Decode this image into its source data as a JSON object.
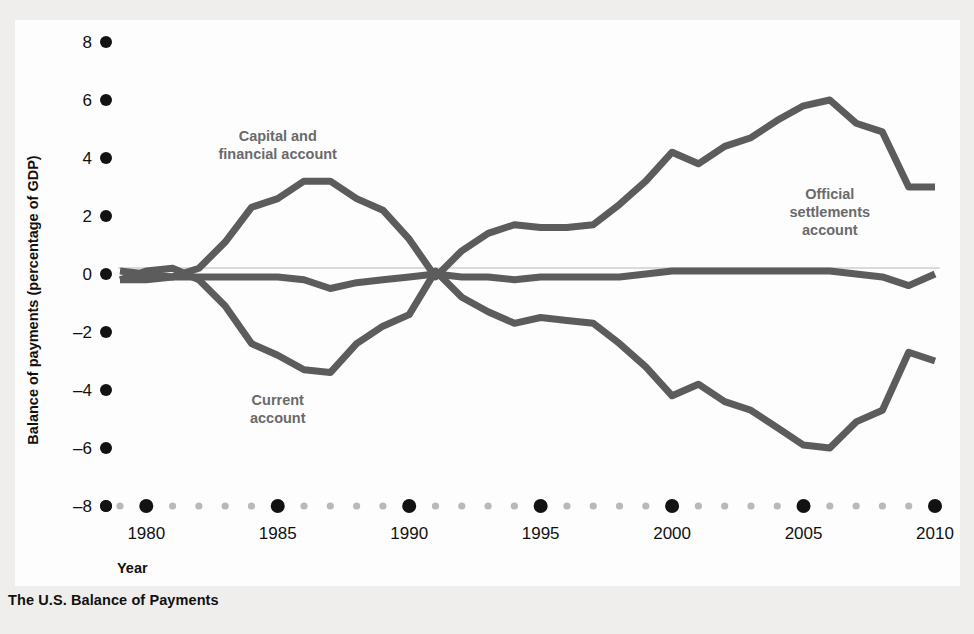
{
  "figure": {
    "caption": "The U.S. Balance of Payments",
    "background_color": "#efeeec",
    "panel_color": "#fdfdfd",
    "line_color": "#5c5c5c",
    "label_color": "#6a6a6a",
    "tick_major_color": "#121212",
    "tick_minor_color": "#b9b9b9"
  },
  "chart_data": {
    "type": "line",
    "title": "The U.S. Balance of Payments",
    "xlabel": "Year",
    "ylabel": "Balance of payments (percentage of GDP)",
    "xlim": [
      1979,
      2010
    ],
    "ylim": [
      -8,
      8
    ],
    "xticks": [
      1980,
      1985,
      1990,
      1995,
      2000,
      2005,
      2010
    ],
    "xticklabels": [
      "1980",
      "1985",
      "1990",
      "1995",
      "2000",
      "2005",
      "2010"
    ],
    "yticks": [
      -8,
      -6,
      -4,
      -2,
      0,
      2,
      4,
      6,
      8
    ],
    "yticklabels": [
      "–8",
      "–6",
      "–4",
      "–2",
      "0",
      "2",
      "4",
      "6",
      "8"
    ],
    "grid": false,
    "legend_position": "inline-annotations",
    "x": [
      1979,
      1980,
      1981,
      1982,
      1983,
      1984,
      1985,
      1986,
      1987,
      1988,
      1989,
      1990,
      1991,
      1992,
      1993,
      1994,
      1995,
      1996,
      1997,
      1998,
      1999,
      2000,
      2001,
      2002,
      2003,
      2004,
      2005,
      2006,
      2007,
      2008,
      2009,
      2010
    ],
    "series": [
      {
        "name": "Capital and financial account",
        "label": "Capital and\nfinancial account",
        "label_lines": [
          "Capital and",
          "financial account"
        ],
        "values": [
          0.1,
          0.0,
          -0.1,
          0.2,
          1.1,
          2.3,
          2.6,
          3.2,
          3.2,
          2.6,
          2.2,
          1.2,
          -0.1,
          0.8,
          1.4,
          1.7,
          1.6,
          1.6,
          1.7,
          2.4,
          3.2,
          4.2,
          3.8,
          4.4,
          4.7,
          5.3,
          5.8,
          6.0,
          5.2,
          4.9,
          3.0,
          3.0
        ]
      },
      {
        "name": "Current account",
        "label": "Current\naccount",
        "label_lines": [
          "Current",
          "account"
        ],
        "values": [
          -0.2,
          0.1,
          0.2,
          -0.2,
          -1.1,
          -2.4,
          -2.8,
          -3.3,
          -3.4,
          -2.4,
          -1.8,
          -1.4,
          0.1,
          -0.8,
          -1.3,
          -1.7,
          -1.5,
          -1.6,
          -1.7,
          -2.4,
          -3.2,
          -4.2,
          -3.8,
          -4.4,
          -4.7,
          -5.3,
          -5.9,
          -6.0,
          -5.1,
          -4.7,
          -2.7,
          -3.0
        ]
      },
      {
        "name": "Official settlements account",
        "label": "Official\nsettlements\naccount",
        "label_lines": [
          "Official",
          "settlements",
          "account"
        ],
        "values": [
          -0.2,
          -0.2,
          -0.1,
          -0.1,
          -0.1,
          -0.1,
          -0.1,
          -0.2,
          -0.5,
          -0.3,
          -0.2,
          -0.1,
          0.0,
          -0.1,
          -0.1,
          -0.2,
          -0.1,
          -0.1,
          -0.1,
          -0.1,
          0.0,
          0.1,
          0.1,
          0.1,
          0.1,
          0.1,
          0.1,
          0.1,
          0.0,
          -0.1,
          -0.4,
          0.0
        ]
      }
    ],
    "annotations": [
      {
        "text": "Capital and financial account",
        "x": 1985.0,
        "y": 4.6
      },
      {
        "text": "Current account",
        "x": 1985.0,
        "y": -4.5
      },
      {
        "text": "Official settlements account",
        "x": 2006.0,
        "y": 2.6
      }
    ]
  }
}
